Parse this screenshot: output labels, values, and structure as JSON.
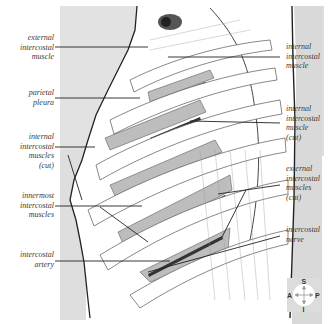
{
  "labels": {
    "left": [
      {
        "lines": [
          "external",
          "intercostal",
          "muscle"
        ]
      },
      {
        "lines": [
          "parietal",
          "pleura"
        ]
      },
      {
        "lines": [
          "internal",
          "intercostal",
          "muscles",
          "(cut)"
        ]
      },
      {
        "lines": [
          "innermost",
          "intercostal",
          "muscles"
        ]
      },
      {
        "lines": [
          "intercostal",
          "artery"
        ]
      }
    ],
    "right": [
      {
        "lines": [
          "internal",
          "intercostal",
          "muscle"
        ]
      },
      {
        "lines": [
          "internal",
          "intercostal",
          "muscle",
          "(cut)"
        ]
      },
      {
        "lines": [
          "external",
          "intercostal",
          "muscles",
          "(cut)"
        ]
      },
      {
        "lines": [
          "intercostal",
          "nerve"
        ]
      }
    ]
  },
  "compass": {
    "superior": "S",
    "inferior": "I",
    "anterior": "A",
    "posterior": "P"
  },
  "colors": {
    "background": "#ffffff",
    "body_shade": "#dcdcdc",
    "muscle_shade": "#b8b8b8",
    "line": "#2a2a2a"
  }
}
